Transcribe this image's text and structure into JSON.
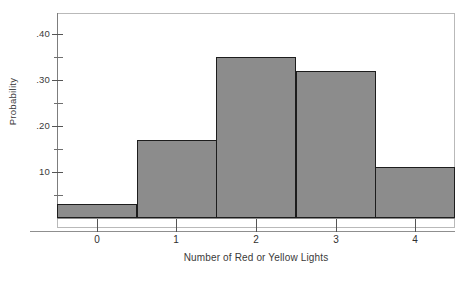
{
  "chart_data": {
    "type": "bar",
    "title": "",
    "xlabel": "Number of Red or Yellow Lights",
    "ylabel": "Probability",
    "categories": [
      "0",
      "1",
      "2",
      "3",
      "4"
    ],
    "values": [
      0.03,
      0.17,
      0.35,
      0.32,
      0.11
    ],
    "xlim": [
      -0.5,
      4.5
    ],
    "ylim": [
      0,
      0.46
    ],
    "grid": false,
    "legend": null,
    "bar_style": {
      "fill": "#8c8c8c",
      "edge": "#1d1d1d",
      "width": 1.0
    },
    "y_ticks": [
      {
        "value": 0.4,
        "label": ".40",
        "major": true
      },
      {
        "value": 0.35,
        "label": "",
        "major": false
      },
      {
        "value": 0.3,
        "label": ".30",
        "major": true
      },
      {
        "value": 0.25,
        "label": "",
        "major": false
      },
      {
        "value": 0.2,
        "label": ".20",
        "major": true
      },
      {
        "value": 0.15,
        "label": "",
        "major": false
      },
      {
        "value": 0.1,
        "label": "10",
        "major": true
      },
      {
        "value": 0.05,
        "label": "",
        "major": false
      }
    ],
    "x_ticks": [
      {
        "value": 0,
        "label": "0"
      },
      {
        "value": 1,
        "label": "1"
      },
      {
        "value": 2,
        "label": "2"
      },
      {
        "value": 3,
        "label": "3"
      },
      {
        "value": 4,
        "label": "4"
      }
    ]
  },
  "figure": {
    "background": "#ffffff",
    "frame_color": "#b9b9b9",
    "text_color": "#3a3a3a"
  }
}
